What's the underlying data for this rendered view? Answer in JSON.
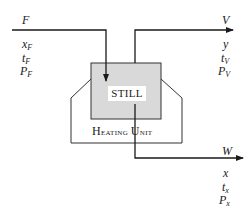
{
  "diagram": {
    "type": "flash-distillation-still",
    "nodes": {
      "still": {
        "label": "STILL",
        "fill": "#d9d9d9"
      },
      "heating_unit": {
        "label_cap1": "H",
        "label_rest1": "eating ",
        "label_cap2": "U",
        "label_rest2": "nit"
      }
    },
    "streams": {
      "feed": {
        "name": "F",
        "vars": [
          {
            "sym": "x",
            "sub": "F"
          },
          {
            "sym": "t",
            "sub": "F"
          },
          {
            "sym": "P",
            "sub": "F"
          }
        ]
      },
      "vapor": {
        "name": "V",
        "vars": [
          {
            "sym": "y",
            "sub": ""
          },
          {
            "sym": "t",
            "sub": "V"
          },
          {
            "sym": "P",
            "sub": "V"
          }
        ]
      },
      "liquid": {
        "name": "W",
        "vars": [
          {
            "sym": "x",
            "sub": ""
          },
          {
            "sym": "t",
            "sub": "x"
          },
          {
            "sym": "P",
            "sub": "x"
          }
        ]
      }
    },
    "edges": [
      {
        "from": "feed",
        "to": "still"
      },
      {
        "from": "still",
        "to": "vapor"
      },
      {
        "from": "still",
        "to": "liquid"
      }
    ],
    "colors": {
      "line": "#1a1a1a",
      "still_fill": "#d9d9d9",
      "background": "#ffffff"
    }
  }
}
